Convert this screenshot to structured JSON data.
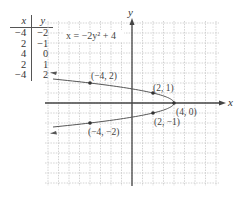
{
  "table": {
    "headers": [
      "x",
      "y"
    ],
    "rows": [
      [
        "−4",
        "−2"
      ],
      [
        "2",
        "−1"
      ],
      [
        "4",
        "0"
      ],
      [
        "2",
        "1"
      ],
      [
        "−4",
        "2"
      ]
    ]
  },
  "graph": {
    "equation_label": "x = −2y² + 4",
    "x_axis_label": "x",
    "y_axis_label": "y",
    "points": [
      {
        "label": "(−4, 2)"
      },
      {
        "label": "(2, 1)"
      },
      {
        "label": "(4, 0)"
      },
      {
        "label": "(2, −1)"
      },
      {
        "label": "(−4, −2)"
      }
    ]
  },
  "chart_data": {
    "type": "line",
    "title": "x = −2y² + 4",
    "xlabel": "x",
    "ylabel": "y",
    "xlim": [
      -8,
      8
    ],
    "ylim": [
      -8,
      8
    ],
    "grid": true,
    "series": [
      {
        "name": "x = −2y² + 4",
        "points": [
          [
            -4,
            -2
          ],
          [
            2,
            -1
          ],
          [
            4,
            0
          ],
          [
            2,
            1
          ],
          [
            -4,
            2
          ]
        ]
      }
    ],
    "table": {
      "x": [
        -4,
        2,
        4,
        2,
        -4
      ],
      "y": [
        -2,
        -1,
        0,
        1,
        2
      ]
    }
  }
}
